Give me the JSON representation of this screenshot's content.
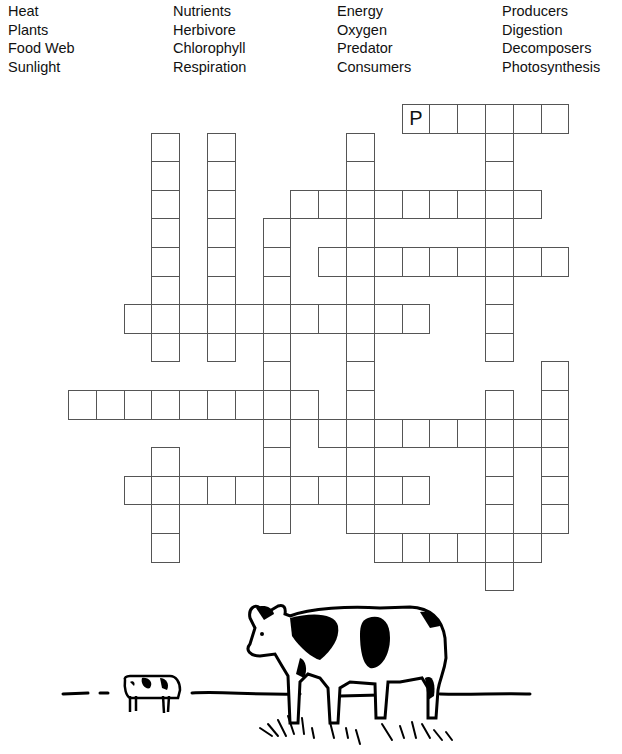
{
  "word_bank": {
    "columns": [
      {
        "words": [
          "Heat",
          "Plants",
          "Food Web",
          "Sunlight"
        ]
      },
      {
        "words": [
          "Nutrients",
          "Herbivore",
          "Chlorophyll",
          "Respiration"
        ]
      },
      {
        "words": [
          "Energy",
          "Oxygen",
          "Predator",
          "Consumers"
        ]
      },
      {
        "words": [
          "Producers",
          "Digestion",
          "Decomposers",
          "Photosynthesis"
        ]
      }
    ]
  },
  "grid": {
    "origin_x": 68,
    "origin_y": 104,
    "cell_w": 27.8,
    "cell_h": 28.6,
    "border_color": "#555555",
    "entries": [
      {
        "dir": "across",
        "row": 0,
        "col": 12,
        "length": 6,
        "given": {
          "0": "P"
        }
      },
      {
        "dir": "down",
        "row": 0,
        "col": 15,
        "length": 9
      },
      {
        "dir": "down",
        "row": 1,
        "col": 3,
        "length": 8
      },
      {
        "dir": "down",
        "row": 1,
        "col": 5,
        "length": 8
      },
      {
        "dir": "down",
        "row": 1,
        "col": 10,
        "length": 14
      },
      {
        "dir": "across",
        "row": 3,
        "col": 8,
        "length": 9
      },
      {
        "dir": "down",
        "row": 4,
        "col": 7,
        "length": 11
      },
      {
        "dir": "across",
        "row": 5,
        "col": 9,
        "length": 9
      },
      {
        "dir": "across",
        "row": 7,
        "col": 2,
        "length": 11
      },
      {
        "dir": "across",
        "row": 10,
        "col": 0,
        "length": 9
      },
      {
        "dir": "across",
        "row": 11,
        "col": 9,
        "length": 9
      },
      {
        "dir": "down",
        "row": 9,
        "col": 17,
        "length": 6
      },
      {
        "dir": "down",
        "row": 10,
        "col": 15,
        "length": 7
      },
      {
        "dir": "across",
        "row": 13,
        "col": 2,
        "length": 11
      },
      {
        "dir": "down",
        "row": 12,
        "col": 3,
        "length": 4
      },
      {
        "dir": "across",
        "row": 15,
        "col": 11,
        "length": 6
      }
    ]
  },
  "illustration": {
    "subject": "cows-in-pasture",
    "description": "Two black-and-white cows standing on a horizon line with grass tufts"
  }
}
